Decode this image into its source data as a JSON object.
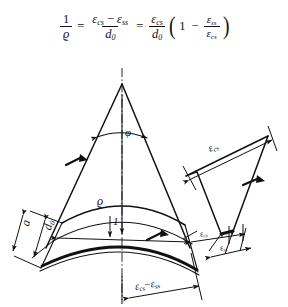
{
  "figure": {
    "caption_present": false,
    "background_color": "#ffffff",
    "ink_color": "#111111"
  },
  "formula": {
    "lhs": {
      "numerator": "1",
      "denominator": "ϱ"
    },
    "equals_1": "=",
    "middle": {
      "numerator_first": "ε",
      "numerator_first_sub": "cs",
      "minus": "−",
      "numerator_second": "ε",
      "numerator_second_sub": "ss",
      "denominator": "d",
      "denominator_sub": "0"
    },
    "equals_2": "=",
    "rhs": {
      "fraction_numerator": "ε",
      "fraction_numerator_sub": "cs",
      "fraction_denominator": "d",
      "fraction_denominator_sub": "0",
      "paren_open": "(",
      "one": "1",
      "minus": "−",
      "inner_numerator": "ε",
      "inner_numerator_sub": "ss",
      "inner_denominator": "ε",
      "inner_denominator_sub": "cs",
      "paren_close": ")"
    }
  },
  "labels": {
    "phi": "φ",
    "rho": "ϱ",
    "one": "1",
    "a": "a",
    "d0_base": "d",
    "d0_sub": "0",
    "eps_cs_top": "ε",
    "eps_cs_top_sub": "cs",
    "eps_cs_small": "ε",
    "eps_cs_small_sub": "cs",
    "eps_ss_small": "ε",
    "eps_ss_small_sub": "ss",
    "bottom_diff_first": "ε",
    "bottom_diff_first_sub": "cs",
    "bottom_diff_minus": "−",
    "bottom_diff_second": "ε",
    "bottom_diff_second_sub": "ss"
  }
}
